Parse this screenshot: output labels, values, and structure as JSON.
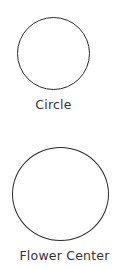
{
  "shapes": [
    {
      "label": "Circle",
      "cx": 53,
      "cy": 53,
      "r": 36
    },
    {
      "label": "Flower Center",
      "cx": 60,
      "cy": 194,
      "r": 48
    }
  ],
  "colors": {
    "stroke": "#2b2b2b",
    "text": "#333333",
    "background": "#ffffff"
  }
}
